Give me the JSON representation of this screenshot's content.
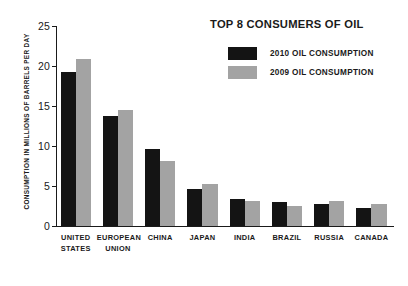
{
  "chart_data": {
    "type": "bar",
    "title": "TOP 8 CONSUMERS OF OIL",
    "xlabel": "",
    "ylabel": "CONSUMPTION IN MILLIONS OF BARRELS PER DAY",
    "ylim": [
      0,
      25
    ],
    "yticks": [
      0,
      5,
      10,
      15,
      20,
      25
    ],
    "ytick_labels": [
      "0",
      "5",
      "10",
      "15",
      "20",
      "25"
    ],
    "grid": false,
    "legend_position": "top-right",
    "categories": [
      "UNITED STATES",
      "EUROPEAN UNION",
      "CHINA",
      "JAPAN",
      "INDIA",
      "BRAZIL",
      "RUSSIA",
      "CANADA"
    ],
    "category_lines": [
      [
        "UNITED",
        "STATES"
      ],
      [
        "EUROPEAN",
        "UNION"
      ],
      [
        "CHINA"
      ],
      [
        "JAPAN"
      ],
      [
        "INDIA"
      ],
      [
        "BRAZIL"
      ],
      [
        "RUSSIA"
      ],
      [
        "CANADA"
      ]
    ],
    "series": [
      {
        "name": "2010 OIL CONSUMPTION",
        "color": "#141414",
        "values": [
          19.3,
          13.7,
          9.6,
          4.6,
          3.3,
          2.9,
          2.7,
          2.2
        ]
      },
      {
        "name": "2009 OIL CONSUMPTION",
        "color": "#a3a3a3",
        "values": [
          20.9,
          14.5,
          8.1,
          5.2,
          3.1,
          2.5,
          3.1,
          2.7
        ]
      }
    ]
  },
  "legend": {
    "items": [
      {
        "label": "2010 OIL CONSUMPTION",
        "color": "#141414"
      },
      {
        "label": "2009 OIL CONSUMPTION",
        "color": "#a3a3a3"
      }
    ]
  },
  "colors": {
    "series_2010": "#141414",
    "series_2009": "#a3a3a3",
    "axis": "#1a1a1a",
    "background": "#ffffff"
  }
}
